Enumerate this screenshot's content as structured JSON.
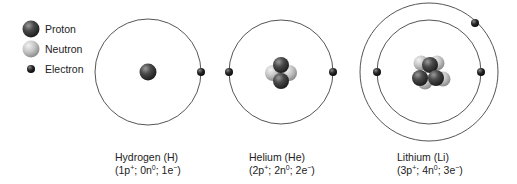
{
  "legend": {
    "items": [
      {
        "label": "Proton",
        "color": "#444444"
      },
      {
        "label": "Neutron",
        "color": "#bdbdbd"
      },
      {
        "label": "Electron",
        "color": "#222222"
      }
    ]
  },
  "atoms": [
    {
      "name": "Hydrogen (H)",
      "protons": "1",
      "neutrons": "0",
      "electrons": "1",
      "composition": {
        "p": "1p",
        "p_sup": "+",
        "n": "0n",
        "n_sup": "0",
        "e": "1e",
        "e_sup": "−"
      },
      "shells": 1
    },
    {
      "name": "Helium (He)",
      "protons": "2",
      "neutrons": "2",
      "electrons": "2",
      "composition": {
        "p": "2p",
        "p_sup": "+",
        "n": "2n",
        "n_sup": "0",
        "e": "2e",
        "e_sup": "−"
      },
      "shells": 1
    },
    {
      "name": "Lithium (Li)",
      "protons": "3",
      "neutrons": "4",
      "electrons": "3",
      "composition": {
        "p": "3p",
        "p_sup": "+",
        "n": "4n",
        "n_sup": "0",
        "e": "3e",
        "e_sup": "−"
      },
      "shells": 2
    }
  ],
  "colors": {
    "orbit": "#555555",
    "proton": "#444444",
    "neutron": "#bdbdbd",
    "electron": "#222222"
  }
}
